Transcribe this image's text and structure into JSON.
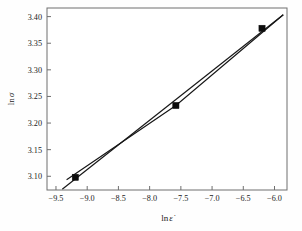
{
  "chart_data": {
    "type": "scatter",
    "title": "",
    "xlabel": "ln ε̇",
    "ylabel": "ln σ",
    "xlim": [
      -9.6438,
      -5.8
    ],
    "ylim": [
      3.0742,
      3.4162
    ],
    "grid": false,
    "legend": "none",
    "xticks": [
      -9.5,
      -9.0,
      -8.5,
      -8.0,
      -7.5,
      -7.0,
      -6.5,
      -6.0
    ],
    "xticklabels": [
      "−9.5",
      "−9.0",
      "−8.5",
      "−8.0",
      "−7.5",
      "−7.0",
      "−6.5",
      "−6.0"
    ],
    "yticks": [
      3.1,
      3.15,
      3.2,
      3.25,
      3.3,
      3.35,
      3.4
    ],
    "yticklabels": [
      "3.10",
      "3.15",
      "3.20",
      "3.25",
      "3.30",
      "3.35",
      "3.40"
    ],
    "points": {
      "name": "measured data",
      "marker": "filled-square",
      "x": [
        -9.19,
        -7.58,
        -6.2
      ],
      "y": [
        3.098,
        3.233,
        3.378
      ]
    },
    "series": [
      {
        "name": "regression fit",
        "style": "solid",
        "x": [
          -9.4,
          -5.86
        ],
        "y": [
          3.0755,
          3.4035
        ]
      },
      {
        "name": "connecting line through points",
        "style": "solid",
        "x": [
          -9.33,
          -7.58,
          -5.86
        ],
        "y": [
          3.0935,
          3.233,
          3.4035
        ]
      }
    ]
  },
  "axis_labels": {
    "x_prefix": "ln",
    "x_symbol": "ε̇",
    "y_prefix": "ln",
    "y_symbol": "σ"
  },
  "colors": {
    "line": "#161616",
    "marker": "#0d0d0d",
    "frame": "#6f6f6f",
    "text": "#1a1a1a",
    "background": "#fefefe"
  }
}
